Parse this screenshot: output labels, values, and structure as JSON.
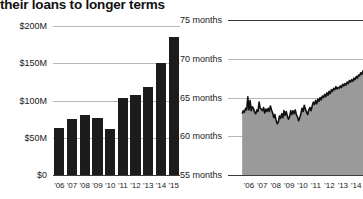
{
  "title": "their loans to longer terms",
  "chart_data": [
    {
      "id": "loans-bar-chart",
      "type": "bar",
      "title": "",
      "xlabel": "",
      "ylabel": "",
      "ylim": [
        0,
        200
      ],
      "yticks": [
        0,
        50,
        100,
        150,
        200
      ],
      "ytick_labels": [
        "$0",
        "$50M",
        "$100M",
        "$150M",
        "$200M"
      ],
      "grid": true,
      "legend": "none",
      "categories": [
        "'06",
        "'07",
        "'08",
        "'09",
        "'10",
        "'11",
        "'12",
        "'13",
        "'14",
        "'15"
      ],
      "values": [
        63,
        75,
        80,
        76,
        62,
        103,
        107,
        118,
        150,
        185
      ],
      "bar_color": "#1c1c1c"
    },
    {
      "id": "loan-term-line-chart",
      "type": "area",
      "title": "",
      "xlabel": "",
      "ylabel": "",
      "ylim": [
        55,
        75
      ],
      "yticks": [
        55,
        60,
        65,
        70,
        75
      ],
      "ytick_labels": [
        "55 months",
        "60 months",
        "65 months",
        "70 months",
        "75 months"
      ],
      "grid": true,
      "legend": "none",
      "categories": [
        "'06",
        "'07",
        "'08",
        "'09",
        "'10",
        "'11",
        "'12",
        "'13",
        "'14"
      ],
      "x": [
        0,
        1,
        2,
        3,
        4,
        5,
        6,
        7,
        8,
        9,
        10,
        11,
        12,
        13,
        14,
        15,
        16,
        17,
        18,
        19,
        20,
        21,
        22,
        23,
        24,
        25,
        26,
        27,
        28,
        29,
        30,
        31,
        32,
        33,
        34,
        35,
        36,
        37,
        38,
        39,
        40,
        41,
        42,
        43,
        44,
        45,
        46,
        47,
        48,
        49,
        50,
        51,
        52,
        53,
        54,
        55,
        56,
        57,
        58,
        59,
        60,
        61,
        62,
        63,
        64,
        65,
        66,
        67,
        68,
        69,
        70,
        71,
        72,
        73,
        74,
        75,
        76,
        77,
        78,
        79,
        80,
        81,
        82,
        83,
        84,
        85,
        86,
        87,
        88,
        89,
        90,
        91,
        92,
        93,
        94,
        95,
        96,
        97,
        98,
        99,
        100,
        101,
        102,
        103,
        104,
        105,
        106,
        107
      ],
      "values": [
        62.9,
        63.3,
        63.1,
        63.6,
        63.4,
        65.1,
        63.4,
        64.6,
        63.3,
        63.8,
        63.6,
        63.1,
        62.9,
        63.4,
        63.2,
        64.4,
        63.6,
        63.5,
        63.3,
        63.7,
        63.0,
        63.5,
        63.2,
        63.6,
        63.2,
        63.9,
        63.4,
        63.0,
        62.4,
        62.8,
        62.1,
        61.6,
        61.8,
        62.6,
        62.3,
        62.9,
        62.4,
        63.3,
        62.7,
        63.2,
        62.6,
        62.2,
        62.5,
        63.3,
        62.8,
        63.3,
        62.9,
        63.4,
        62.8,
        62.5,
        62.0,
        62.4,
        62.9,
        63.6,
        63.2,
        64.0,
        63.5,
        63.1,
        62.8,
        63.4,
        63.7,
        63.3,
        63.9,
        64.4,
        64.1,
        64.6,
        64.2,
        64.8,
        64.5,
        65.0,
        64.7,
        65.2,
        65.0,
        65.4,
        65.1,
        65.6,
        65.3,
        65.8,
        65.5,
        66.0,
        65.8,
        66.2,
        66.0,
        66.4,
        66.1,
        66.3,
        66.2,
        66.5,
        66.3,
        66.7,
        66.5,
        66.8,
        66.6,
        67.0,
        66.8,
        67.2,
        67.0,
        67.3,
        67.1,
        67.5,
        67.3,
        67.7,
        67.5,
        67.9,
        67.8,
        68.2,
        68.0,
        68.5
      ],
      "line_color": "#111111",
      "fill_color": "#9a9a9a"
    }
  ]
}
